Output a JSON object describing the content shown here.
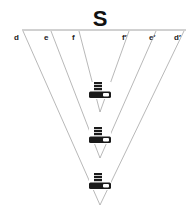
{
  "title": "S",
  "labels": {
    "d": "d",
    "e": "e",
    "f": "f",
    "f_prime": "f′",
    "e_prime": "e′",
    "d_prime": "d′"
  },
  "icons": [
    {
      "name": "disk-stack-icon",
      "level": "f"
    },
    {
      "name": "disk-stack-icon",
      "level": "e"
    },
    {
      "name": "disk-stack-icon",
      "level": "d"
    }
  ],
  "colors": {
    "lines": "#9a9a9a",
    "text": "#111111",
    "icon": "#1a1a1a"
  }
}
